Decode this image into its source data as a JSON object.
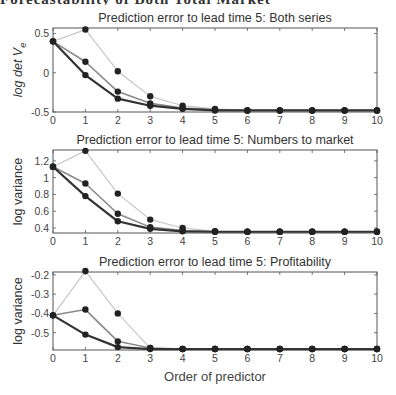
{
  "header_cutoff_text": "Forecastability of Both Total Market",
  "xlabel": "Order of predictor",
  "chart_data": [
    {
      "type": "line",
      "title": "Prediction error to lead time 5: Both series",
      "ylabel": "log det V_e",
      "ylabel_main": "log det V",
      "ylabel_sub": "e",
      "xlabel": "",
      "x": [
        0,
        1,
        2,
        3,
        4,
        5,
        6,
        7,
        8,
        9,
        10
      ],
      "xlim": [
        0,
        10
      ],
      "ylim": [
        -0.5,
        0.57
      ],
      "yticks": [
        -0.5,
        0,
        0.5
      ],
      "ytick_labels": [
        "-0.5",
        "0",
        "0.5"
      ],
      "series": [
        {
          "name": "light",
          "color": "#c8c8c8",
          "width": 1.2,
          "values": [
            0.4,
            0.55,
            0.02,
            -0.3,
            -0.42,
            -0.46,
            -0.48,
            -0.48,
            -0.48,
            -0.48,
            -0.48
          ]
        },
        {
          "name": "medium",
          "color": "#8a8a8a",
          "width": 1.6,
          "values": [
            0.4,
            0.14,
            -0.24,
            -0.39,
            -0.45,
            -0.47,
            -0.48,
            -0.48,
            -0.48,
            -0.48,
            -0.48
          ]
        },
        {
          "name": "dark",
          "color": "#333333",
          "width": 2.2,
          "values": [
            0.4,
            -0.03,
            -0.33,
            -0.42,
            -0.46,
            -0.48,
            -0.48,
            -0.48,
            -0.48,
            -0.48,
            -0.48
          ]
        }
      ]
    },
    {
      "type": "line",
      "title": "Prediction error to lead time 5: Numbers to market",
      "ylabel": "log variance",
      "xlabel": "",
      "x": [
        0,
        1,
        2,
        3,
        4,
        5,
        6,
        7,
        8,
        9,
        10
      ],
      "xlim": [
        0,
        10
      ],
      "ylim": [
        0.34,
        1.33
      ],
      "yticks": [
        0.4,
        0.6,
        0.8,
        1.0,
        1.2
      ],
      "ytick_labels": [
        "0.4",
        "0.6",
        "0.8",
        "1",
        "1.2"
      ],
      "series": [
        {
          "name": "light",
          "color": "#c8c8c8",
          "width": 1.2,
          "values": [
            1.13,
            1.32,
            0.81,
            0.5,
            0.4,
            0.36,
            0.355,
            0.355,
            0.355,
            0.355,
            0.355
          ]
        },
        {
          "name": "medium",
          "color": "#8a8a8a",
          "width": 1.6,
          "values": [
            1.13,
            0.93,
            0.57,
            0.41,
            0.37,
            0.355,
            0.355,
            0.355,
            0.355,
            0.355,
            0.355
          ]
        },
        {
          "name": "dark",
          "color": "#333333",
          "width": 2.2,
          "values": [
            1.13,
            0.78,
            0.48,
            0.39,
            0.36,
            0.355,
            0.355,
            0.355,
            0.355,
            0.355,
            0.355
          ]
        }
      ]
    },
    {
      "type": "line",
      "title": "Prediction error to lead time 5: Profitability",
      "ylabel": "log variance",
      "xlabel": "Order of predictor",
      "x": [
        0,
        1,
        2,
        3,
        4,
        5,
        6,
        7,
        8,
        9,
        10
      ],
      "xlim": [
        0,
        10
      ],
      "ylim": [
        -0.59,
        -0.185
      ],
      "yticks": [
        -0.5,
        -0.4,
        -0.3,
        -0.2
      ],
      "ytick_labels": [
        "-0.5",
        "-0.4",
        "-0.3",
        "-0.2"
      ],
      "series": [
        {
          "name": "light",
          "color": "#c8c8c8",
          "width": 1.2,
          "values": [
            -0.41,
            -0.18,
            -0.4,
            -0.58,
            -0.585,
            -0.585,
            -0.585,
            -0.585,
            -0.585,
            -0.585,
            -0.585
          ]
        },
        {
          "name": "medium",
          "color": "#8a8a8a",
          "width": 1.6,
          "values": [
            -0.41,
            -0.38,
            -0.545,
            -0.58,
            -0.585,
            -0.585,
            -0.585,
            -0.585,
            -0.585,
            -0.585,
            -0.585
          ]
        },
        {
          "name": "dark",
          "color": "#333333",
          "width": 2.2,
          "values": [
            -0.41,
            -0.51,
            -0.575,
            -0.585,
            -0.585,
            -0.585,
            -0.585,
            -0.585,
            -0.585,
            -0.585,
            -0.585
          ]
        }
      ]
    }
  ],
  "layout": {
    "panels": [
      {
        "left": 53,
        "right": 377,
        "top": 28,
        "bottom": 112,
        "title_y": 22
      },
      {
        "left": 53,
        "right": 377,
        "top": 150,
        "bottom": 233,
        "title_y": 144
      },
      {
        "left": 53,
        "right": 377,
        "top": 272,
        "bottom": 350,
        "title_y": 266
      }
    ],
    "xlabel_y": 381
  },
  "colors": {
    "axis": "#555555",
    "text": "#333333",
    "marker": "#222222"
  }
}
